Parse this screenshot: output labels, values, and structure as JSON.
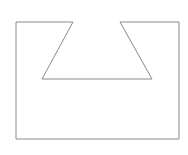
{
  "diagram": {
    "type": "polygon-outline",
    "stroke_color": "#8a8a8a",
    "fill_color": "#ffffff",
    "stroke_width": 1,
    "points": [
      [
        16,
        22
      ],
      [
        73,
        22
      ],
      [
        42,
        79
      ],
      [
        152,
        79
      ],
      [
        120,
        22
      ],
      [
        179,
        22
      ],
      [
        179,
        139
      ],
      [
        16,
        139
      ]
    ]
  }
}
